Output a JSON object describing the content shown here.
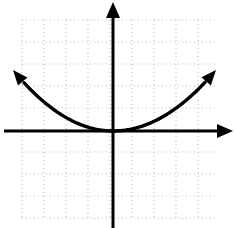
{
  "figure": {
    "width": 236,
    "height": 228,
    "background_color": "#ffffff"
  },
  "colors": {
    "axis": "#000000",
    "curve": "#000000",
    "grid_dot": "#b8b8b8"
  },
  "grid": {
    "style": "dotted",
    "spacing_px": 22,
    "x_start": 22,
    "x_end": 216,
    "y_start": 20,
    "y_end": 218,
    "dot_size": 1,
    "dash_pattern": "1 3"
  },
  "axes": {
    "origin_x": 113,
    "origin_y": 131,
    "stroke_width": 3,
    "x_axis": {
      "name": "x-axis",
      "from_x": 4,
      "to_x": 222,
      "y": 131,
      "arrow_end": "right",
      "arrow_tip_x": 233,
      "label": ""
    },
    "y_axis": {
      "name": "y-axis",
      "from_y": 14,
      "to_y": 228,
      "x": 113,
      "arrow_end": "up",
      "arrow_tip_y": 2,
      "label": ""
    }
  },
  "chart_data": {
    "type": "line",
    "xlabel": "",
    "ylabel": "",
    "grid": true,
    "legend": null,
    "curve_name": "parabola",
    "equation": "y = a x^2, a > 0",
    "vertex": [
      0,
      0
    ],
    "opens": "up",
    "axis_of_symmetry": "x = 0",
    "xlim": [
      -5.0,
      5.5
    ],
    "ylim": [
      -4.0,
      5.8
    ],
    "x": [
      -4.55,
      -4.0,
      -3.5,
      -3.0,
      -2.5,
      -2.0,
      -1.5,
      -1.0,
      -0.5,
      0.0,
      0.5,
      1.0,
      1.5,
      2.0,
      2.5,
      3.0,
      3.5,
      4.0,
      4.68
    ],
    "y": [
      2.77,
      2.14,
      1.64,
      1.21,
      0.84,
      0.53,
      0.3,
      0.13,
      0.03,
      0.0,
      0.03,
      0.13,
      0.3,
      0.53,
      0.84,
      1.21,
      1.64,
      2.14,
      2.93
    ],
    "endpoints": {
      "left_arrow_tip": [
        -4.55,
        2.77
      ],
      "right_arrow_tip": [
        4.68,
        2.93
      ]
    },
    "pixel_path": {
      "left_arrow_tip": [
        13,
        70
      ],
      "right_arrow_tip": [
        216,
        70
      ],
      "vertex_px": [
        113,
        130
      ]
    }
  }
}
